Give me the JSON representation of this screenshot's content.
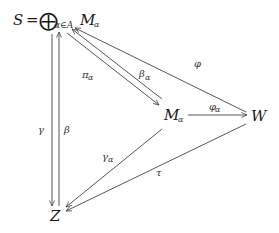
{
  "diagram": {
    "type": "commutative-diagram",
    "nodes": {
      "S": {
        "lhs": "S",
        "eq": "=",
        "oplus": "⨁",
        "index": "α∈A",
        "summand": "M",
        "summand_sub": "α"
      },
      "M": {
        "base": "M",
        "sub": "α"
      },
      "W": {
        "label": "W"
      },
      "Z": {
        "label": "Z"
      }
    },
    "edges": [
      {
        "id": "pi",
        "from": "S",
        "to": "M",
        "label": "π",
        "sub": "α"
      },
      {
        "id": "beta_a",
        "from": "M",
        "to": "S",
        "label": "β",
        "sub": "α"
      },
      {
        "id": "phi",
        "from": "W",
        "to": "S",
        "label": "φ",
        "sub": ""
      },
      {
        "id": "phi_a",
        "from": "M",
        "to": "W",
        "label": "φ",
        "sub": "α"
      },
      {
        "id": "gamma",
        "from": "S",
        "to": "Z",
        "label": "γ",
        "sub": ""
      },
      {
        "id": "beta",
        "from": "Z",
        "to": "S",
        "label": "β",
        "sub": ""
      },
      {
        "id": "gamma_a",
        "from": "M",
        "to": "Z",
        "label": "γ",
        "sub": "α"
      },
      {
        "id": "tau",
        "from": "W",
        "to": "Z",
        "label": "τ",
        "sub": ""
      }
    ]
  }
}
